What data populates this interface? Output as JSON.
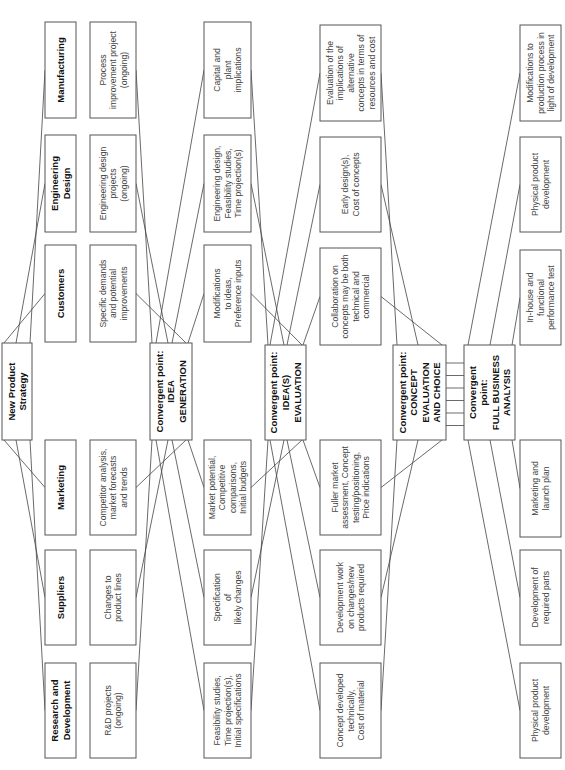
{
  "diagram": {
    "orientation": "rotated-90-ccw",
    "strategy": {
      "lines": [
        "New Product",
        "Strategy"
      ]
    },
    "departments": [
      {
        "id": "rd",
        "lines": [
          "Research and",
          "Development"
        ]
      },
      {
        "id": "suppliers",
        "lines": [
          "Suppliers"
        ]
      },
      {
        "id": "marketing",
        "lines": [
          "Marketing"
        ]
      },
      {
        "id": "customers",
        "lines": [
          "Customers"
        ]
      },
      {
        "id": "engineering",
        "lines": [
          "Engineering",
          "Design"
        ]
      },
      {
        "id": "manufacturing",
        "lines": [
          "Manufacturing"
        ]
      }
    ],
    "stage1_inputs": [
      {
        "dept": "rd",
        "lines": [
          "R&D projects",
          "(ongoing)"
        ]
      },
      {
        "dept": "suppliers",
        "lines": [
          "Changes to",
          "product lines"
        ]
      },
      {
        "dept": "marketing",
        "lines": [
          "Competitor analysis,",
          "market forecasts",
          "and trends"
        ]
      },
      {
        "dept": "customers",
        "lines": [
          "Specific demands",
          "and potential",
          "improvements"
        ]
      },
      {
        "dept": "engineering",
        "lines": [
          "Engineering design",
          "projects",
          "(ongoing)"
        ]
      },
      {
        "dept": "manufacturing",
        "lines": [
          "Process",
          "improvement project",
          "(ongoing)"
        ]
      }
    ],
    "convergent_idea_generation": {
      "lines": [
        "Convergent point:",
        "IDEA",
        "GENERATION"
      ]
    },
    "stage2_inputs": [
      {
        "dept": "rd",
        "lines": [
          "Feasibility studies,",
          "Time projection(s),",
          "Initial specifications"
        ]
      },
      {
        "dept": "suppliers",
        "lines": [
          "Specification",
          "of",
          "likely changes"
        ]
      },
      {
        "dept": "marketing",
        "lines": [
          "Market potential,",
          "Competitive",
          "comparisons,",
          "Initial budgets"
        ]
      },
      {
        "dept": "customers",
        "lines": [
          "Modifications",
          "to ideas,",
          "Preference inputs"
        ]
      },
      {
        "dept": "engineering",
        "lines": [
          "Engineering design,",
          "Feasibility studies,",
          "Time projection(s)"
        ]
      },
      {
        "dept": "manufacturing",
        "lines": [
          "Capital and",
          "plant",
          "implications"
        ]
      }
    ],
    "convergent_idea_evaluation": {
      "lines": [
        "Convergent point:",
        "IDEA(S)",
        "EVALUATION"
      ]
    },
    "stage3_inputs": [
      {
        "dept": "rd",
        "lines": [
          "Concept developed",
          "technically,",
          "Cost of material"
        ]
      },
      {
        "dept": "suppliers",
        "lines": [
          "Development work",
          "on changes/new",
          "products required"
        ]
      },
      {
        "dept": "marketing",
        "lines": [
          "Fuller market",
          "assessment, Concept",
          "testing/positioning,",
          "Price indications"
        ]
      },
      {
        "dept": "customers",
        "lines": [
          "Collaboration on",
          "concepts may be both",
          "technical and",
          "commercial"
        ]
      },
      {
        "dept": "engineering",
        "lines": [
          "Early design(s),",
          "Cost of concepts"
        ]
      },
      {
        "dept": "manufacturing",
        "lines": [
          "Evaluation of the",
          "implications of",
          "alternative",
          "concepts in terms of",
          "resources and cost"
        ]
      }
    ],
    "convergent_concept_evaluation": {
      "lines": [
        "Convergent point:",
        "CONCEPT",
        "EVALUATION",
        "AND CHOICE"
      ]
    },
    "convergent_business_analysis": {
      "lines": [
        "Convergent",
        "point:",
        "FULL BUSINESS",
        "ANALYSIS"
      ]
    },
    "stage4_outputs": [
      {
        "dept": "rd",
        "lines": [
          "Physical product",
          "development"
        ]
      },
      {
        "dept": "suppliers",
        "lines": [
          "Development of",
          "required parts"
        ]
      },
      {
        "dept": "marketing",
        "lines": [
          "Marketing and",
          "launch plan"
        ]
      },
      {
        "dept": "customers",
        "lines": [
          "In-house and",
          "functional",
          "performance test"
        ]
      },
      {
        "dept": "engineering",
        "lines": [
          "Physical product",
          "development"
        ]
      },
      {
        "dept": "manufacturing",
        "lines": [
          "Modifications to",
          "production process in",
          "light of development"
        ]
      }
    ]
  }
}
